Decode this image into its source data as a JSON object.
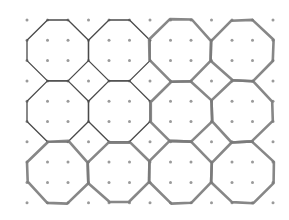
{
  "diagram": {
    "title": "",
    "grid": {
      "columns": 13,
      "rows": 10,
      "origin_x": 27,
      "origin_y": 20,
      "spacing_x": 20.5,
      "spacing_y": 20.3,
      "dot_color": "#9a9a9a",
      "dot_radius": 1.5
    },
    "octagon": {
      "span_cells": 3,
      "octagon_columns": 4,
      "octagon_rows": 3
    },
    "styles": {
      "thin_stroke": "#4a4a4a",
      "thick_stroke": "#7a7a7a"
    },
    "octagons": [
      {
        "col": 0,
        "row": 0,
        "style": "thin"
      },
      {
        "col": 1,
        "row": 0,
        "style": "thin"
      },
      {
        "col": 2,
        "row": 0,
        "style": "thick"
      },
      {
        "col": 3,
        "row": 0,
        "style": "thick"
      },
      {
        "col": 0,
        "row": 1,
        "style": "thin"
      },
      {
        "col": 1,
        "row": 1,
        "style": "thin"
      },
      {
        "col": 2,
        "row": 1,
        "style": "thick"
      },
      {
        "col": 3,
        "row": 1,
        "style": "thick"
      },
      {
        "col": 0,
        "row": 2,
        "style": "thick"
      },
      {
        "col": 1,
        "row": 2,
        "style": "thick"
      },
      {
        "col": 2,
        "row": 2,
        "style": "thick"
      },
      {
        "col": 3,
        "row": 2,
        "style": "thick"
      }
    ]
  }
}
